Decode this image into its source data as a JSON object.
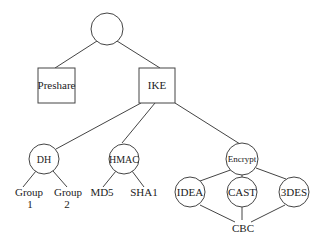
{
  "diagram": {
    "title": "",
    "nodes": {
      "root": {
        "label": ""
      },
      "preshare": {
        "label": "Preshare"
      },
      "ike": {
        "label": "IKE"
      },
      "dh": {
        "label": "DH"
      },
      "hmac": {
        "label": "HMAC"
      },
      "encrypt": {
        "label": "Encrypt"
      },
      "group1": {
        "line1": "Group",
        "line2": "1"
      },
      "group2": {
        "line1": "Group",
        "line2": "2"
      },
      "md5": {
        "label": "MD5"
      },
      "sha1": {
        "label": "SHA1"
      },
      "idea": {
        "label": "IDEA"
      },
      "cast": {
        "label": "CAST"
      },
      "3des": {
        "label": "3DES"
      },
      "cbc": {
        "label": "CBC"
      }
    },
    "edges": [
      [
        "root",
        "preshare"
      ],
      [
        "root",
        "ike"
      ],
      [
        "ike",
        "dh"
      ],
      [
        "ike",
        "hmac"
      ],
      [
        "ike",
        "encrypt"
      ],
      [
        "dh",
        "group1"
      ],
      [
        "dh",
        "group2"
      ],
      [
        "hmac",
        "md5"
      ],
      [
        "hmac",
        "sha1"
      ],
      [
        "encrypt",
        "idea"
      ],
      [
        "encrypt",
        "cast"
      ],
      [
        "encrypt",
        "3des"
      ],
      [
        "idea",
        "cbc"
      ],
      [
        "cast",
        "cbc"
      ],
      [
        "3des",
        "cbc"
      ]
    ],
    "colors": {
      "stroke": "#444444",
      "text": "#222222",
      "background": "#ffffff"
    }
  }
}
